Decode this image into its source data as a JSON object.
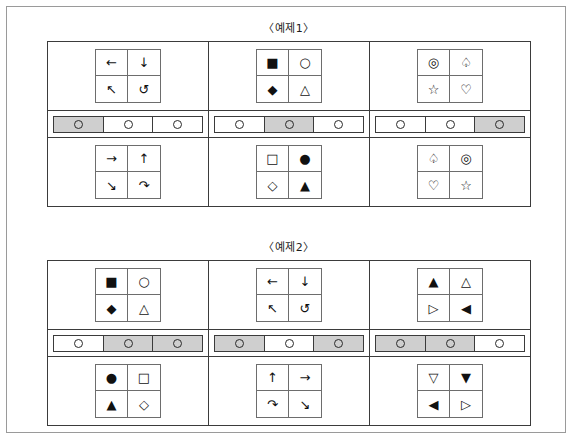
{
  "page": {
    "background_color": "#ffffff",
    "frame_border_color": "#9a9a9a",
    "shaded_cell_color": "#cfcfcf",
    "line_color": "#3b3b3b"
  },
  "examples": [
    {
      "id": "example-1",
      "title": "〈예제1〉",
      "columns": [
        {
          "index": 1,
          "top_matrix": {
            "kind": "arrows",
            "cells": [
              "←",
              "↓",
              "↖",
              "↺"
            ],
            "cell_names": [
              "arrow-left",
              "arrow-down",
              "arrow-up-left",
              "rotate-counterclockwise"
            ]
          },
          "slider": {
            "cells": 3,
            "shaded": [
              1
            ],
            "knob_icon": "circle-outline"
          },
          "bottom_matrix": {
            "kind": "arrows",
            "cells": [
              "→",
              "↑",
              "↘",
              "↷"
            ],
            "cell_names": [
              "arrow-right",
              "arrow-up",
              "arrow-down-right",
              "rotate-clockwise"
            ]
          }
        },
        {
          "index": 2,
          "top_matrix": {
            "kind": "shapes",
            "cells": [
              "■",
              "○",
              "◆",
              "△"
            ],
            "cell_names": [
              "square-filled",
              "circle-outline",
              "diamond-filled",
              "triangle-up-outline"
            ]
          },
          "slider": {
            "cells": 3,
            "shaded": [
              2
            ],
            "knob_icon": "circle-outline"
          },
          "bottom_matrix": {
            "kind": "shapes",
            "cells": [
              "□",
              "●",
              "◇",
              "▲"
            ],
            "cell_names": [
              "square-outline",
              "circle-filled",
              "diamond-outline",
              "triangle-up-filled"
            ]
          }
        },
        {
          "index": 3,
          "top_matrix": {
            "kind": "symbols",
            "cells": [
              "◎",
              "♤",
              "☆",
              "♡"
            ],
            "cell_names": [
              "double-circle",
              "spade-outline",
              "star-outline",
              "heart-outline"
            ]
          },
          "slider": {
            "cells": 3,
            "shaded": [
              3
            ],
            "knob_icon": "circle-outline"
          },
          "bottom_matrix": {
            "kind": "symbols",
            "cells": [
              "♤",
              "◎",
              "♡",
              "☆"
            ],
            "cell_names": [
              "spade-outline",
              "double-circle",
              "heart-outline",
              "star-outline"
            ]
          }
        }
      ]
    },
    {
      "id": "example-2",
      "title": "〈예제2〉",
      "columns": [
        {
          "index": 1,
          "top_matrix": {
            "kind": "shapes",
            "cells": [
              "■",
              "○",
              "◆",
              "△"
            ],
            "cell_names": [
              "square-filled",
              "circle-outline",
              "diamond-filled",
              "triangle-up-outline"
            ]
          },
          "slider": {
            "cells": 3,
            "shaded": [
              2,
              3
            ],
            "knob_icon": "circle-outline"
          },
          "bottom_matrix": {
            "kind": "shapes",
            "cells": [
              "●",
              "□",
              "▲",
              "◇"
            ],
            "cell_names": [
              "circle-filled",
              "square-outline",
              "triangle-up-filled",
              "diamond-outline"
            ]
          }
        },
        {
          "index": 2,
          "top_matrix": {
            "kind": "arrows",
            "cells": [
              "←",
              "↓",
              "↖",
              "↺"
            ],
            "cell_names": [
              "arrow-left",
              "arrow-down",
              "arrow-up-left",
              "rotate-counterclockwise"
            ]
          },
          "slider": {
            "cells": 3,
            "shaded": [
              1,
              3
            ],
            "knob_icon": "circle-outline"
          },
          "bottom_matrix": {
            "kind": "arrows",
            "cells": [
              "↑",
              "→",
              "↷",
              "↘"
            ],
            "cell_names": [
              "arrow-up",
              "arrow-right",
              "rotate-clockwise",
              "arrow-down-right"
            ]
          }
        },
        {
          "index": 3,
          "top_matrix": {
            "kind": "triangles",
            "cells": [
              "▲",
              "△",
              "▷",
              "◀"
            ],
            "cell_names": [
              "triangle-up-filled",
              "triangle-up-outline",
              "triangle-right-outline",
              "triangle-left-filled"
            ]
          },
          "slider": {
            "cells": 3,
            "shaded": [
              1,
              2
            ],
            "knob_icon": "circle-outline"
          },
          "bottom_matrix": {
            "kind": "triangles",
            "cells": [
              "▽",
              "▼",
              "◀",
              "▷"
            ],
            "cell_names": [
              "triangle-down-outline",
              "triangle-down-filled",
              "triangle-left-filled",
              "triangle-right-outline"
            ]
          }
        }
      ]
    }
  ]
}
